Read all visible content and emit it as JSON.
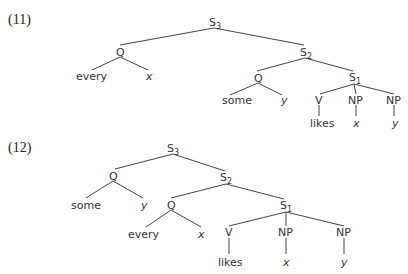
{
  "examples": [
    {
      "label": "(11)",
      "nodes": {
        "s3": {
          "text": "S",
          "sub": "3"
        },
        "q1": {
          "text": "Q"
        },
        "every": {
          "text": "every"
        },
        "x1": {
          "text": "x"
        },
        "s2": {
          "text": "S",
          "sub": "2"
        },
        "q2": {
          "text": "Q"
        },
        "some": {
          "text": "some"
        },
        "y1": {
          "text": "y"
        },
        "s1": {
          "text": "S",
          "sub": "1"
        },
        "v": {
          "text": "V"
        },
        "np1": {
          "text": "NP"
        },
        "np2": {
          "text": "NP"
        },
        "likes": {
          "text": "likes"
        },
        "x2": {
          "text": "x"
        },
        "y2": {
          "text": "y"
        }
      }
    },
    {
      "label": "(12)",
      "nodes": {
        "s3": {
          "text": "S",
          "sub": "3"
        },
        "q1": {
          "text": "Q"
        },
        "some": {
          "text": "some"
        },
        "y1": {
          "text": "y"
        },
        "s2": {
          "text": "S",
          "sub": "2"
        },
        "q2": {
          "text": "Q"
        },
        "every": {
          "text": "every"
        },
        "x1": {
          "text": "x"
        },
        "s1": {
          "text": "S",
          "sub": "1"
        },
        "v": {
          "text": "V"
        },
        "np1": {
          "text": "NP"
        },
        "np2": {
          "text": "NP"
        },
        "likes": {
          "text": "likes"
        },
        "x2": {
          "text": "x"
        },
        "y2": {
          "text": "y"
        }
      }
    }
  ]
}
